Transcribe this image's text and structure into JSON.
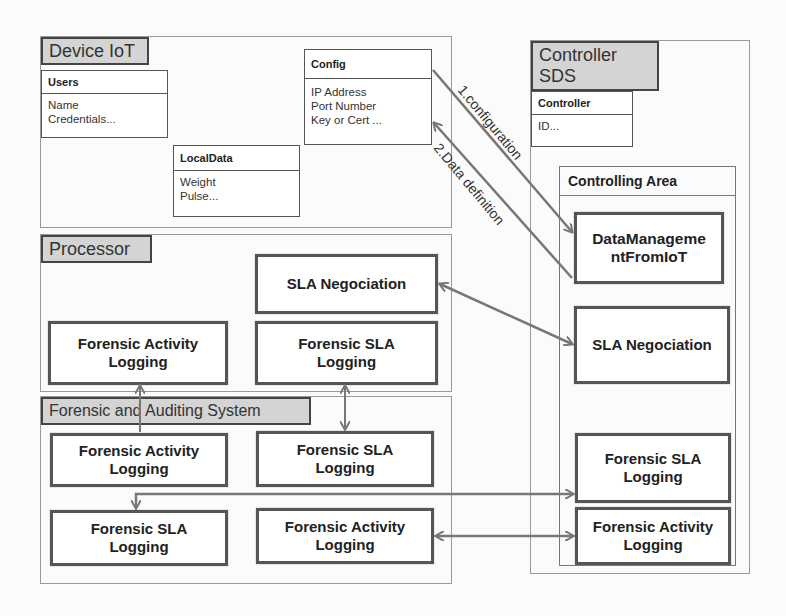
{
  "device_iot": {
    "title": "Device IoT",
    "users": {
      "title": "Users",
      "fields": [
        "Name",
        "Credentials..."
      ]
    },
    "config": {
      "title": "Config",
      "fields": [
        "IP Address",
        "Port Number",
        "Key or Cert ..."
      ]
    },
    "local_data": {
      "title": "LocalData",
      "fields": [
        "Weight",
        "Pulse..."
      ]
    }
  },
  "processor": {
    "title": "Processor",
    "components": [
      "SLA Negociation",
      "Forensic Activity Logging",
      "Forensic SLA Logging"
    ]
  },
  "forensic_system": {
    "title": "Forensic and Auditing System",
    "components": [
      "Forensic Activity Logging",
      "Forensic SLA Logging",
      "Forensic SLA Logging",
      "Forensic Activity Logging"
    ]
  },
  "controller_sds": {
    "title_line1": "Controller",
    "title_line2": "SDS",
    "controller": {
      "title": "Controller",
      "fields": [
        "ID..."
      ]
    },
    "controlling_area": {
      "title": "Controlling Area",
      "components": [
        "DataManagementFromIoT",
        "SLA Negociation",
        "Forensic SLA Logging",
        "Forensic Activity Logging"
      ],
      "dm_line1": "DataManageme",
      "dm_line2": "ntFromIoT"
    }
  },
  "arrows": {
    "configuration": "1.configuration",
    "data_definition": "2.Data definition"
  },
  "colors": {
    "header_fill": "#d4d4d4",
    "arrow": "#777777",
    "border": "#555555"
  }
}
